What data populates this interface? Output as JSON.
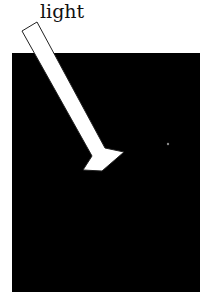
{
  "diagram": {
    "label": "light",
    "colors": {
      "box": "#000000",
      "arrow": "#ffffff",
      "outline": "#222222"
    },
    "elements": [
      "black-rectangle",
      "light-arrow",
      "small-dot"
    ]
  }
}
